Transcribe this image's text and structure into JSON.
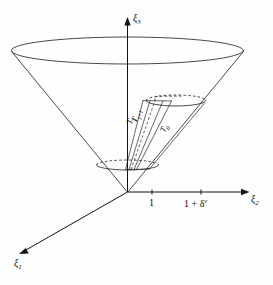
{
  "figure": {
    "type": "math-diagram",
    "background_color": "#fefefe",
    "line_color": "#1a1a1a"
  },
  "axes": {
    "vertical": {
      "name": "xi3",
      "label": "ξ",
      "subscript": "3",
      "direction": "up"
    },
    "horizontal": {
      "name": "xi2",
      "label": "ξ",
      "subscript": "2",
      "direction": "right"
    },
    "depth": {
      "name": "xi1",
      "label": "ξ",
      "subscript": "1",
      "direction": "down-left"
    }
  },
  "ticks": [
    {
      "name": "tick-one",
      "label": "1",
      "x": 152
    },
    {
      "name": "tick-one-plus-delta",
      "label_html": "1 + δ<sup>ν</sup>",
      "label": "1 + δν",
      "x": 201
    }
  ],
  "region_labels": [
    {
      "name": "T-j-plus-1",
      "label": "T",
      "subscript": "j+1"
    },
    {
      "name": "T-j",
      "label": "T",
      "subscript": "j"
    },
    {
      "name": "T-0",
      "label": "T",
      "subscript": "0"
    }
  ],
  "chart_data": {
    "type": "line",
    "title": "",
    "xlabel": "ξ2",
    "ylabel": "ξ3",
    "annotations": [
      "T_{j+1}",
      "T_j",
      "T_0",
      "1",
      "1 + δ^ν"
    ],
    "grid": false,
    "legend": "none"
  }
}
